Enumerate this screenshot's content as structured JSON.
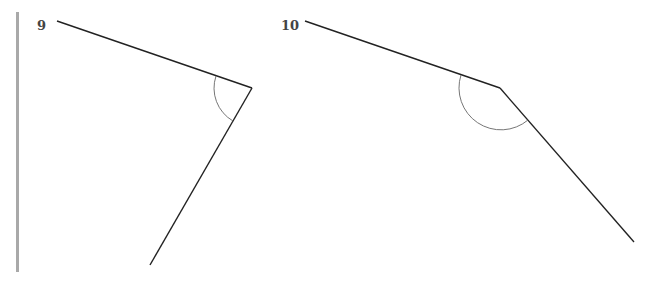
{
  "figures": [
    {
      "label": "9",
      "label_pos": [
        37,
        18
      ],
      "ray1_end": [
        57,
        21
      ],
      "vertex": [
        252,
        88
      ],
      "ray2_end": [
        150,
        265
      ],
      "arc": {
        "start": [
          216,
          78
        ],
        "end": [
          232,
          123
        ],
        "radius": 38
      }
    },
    {
      "label": "10",
      "label_pos": [
        281,
        18
      ],
      "ray1_end": [
        305,
        21
      ],
      "vertex": [
        500,
        88
      ],
      "ray2_end": [
        634,
        242
      ],
      "arc": {
        "start": [
          461,
          76
        ],
        "end": [
          528,
          120
        ],
        "radius": 42
      }
    }
  ],
  "colors": {
    "line": "#222222",
    "arc": "#666666",
    "margin_bar": "#a9a9a9",
    "label": "#444444"
  }
}
